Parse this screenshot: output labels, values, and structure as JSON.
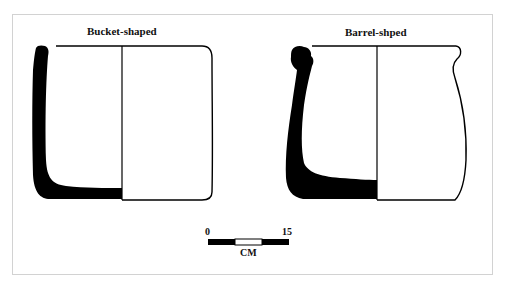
{
  "header": {
    "faint_text": ""
  },
  "figure": {
    "vessels": [
      {
        "name": "bucket",
        "label": "Bucket-shaped"
      },
      {
        "name": "barrel",
        "label": "Barrel-shped"
      }
    ],
    "scale_bar": {
      "min_label": "0",
      "max_label": "15",
      "unit": "CM"
    },
    "colors": {
      "section_fill": "#000000",
      "outline": "#000000",
      "frame": "#d2d2d2"
    }
  }
}
